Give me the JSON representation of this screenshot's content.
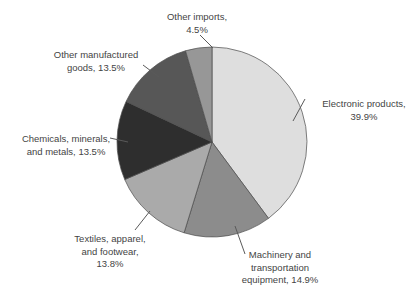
{
  "chart_data": {
    "type": "pie",
    "title": "",
    "unit": "%",
    "start_angle_deg": 0,
    "direction": "clockwise",
    "background_color": "#ffffff",
    "label_color": "#444444",
    "outline_color": "#4c4c4c",
    "leader_color": "#5a5a5a",
    "slices": [
      {
        "label": "Electronic products",
        "value": 39.9,
        "color": "#dedede",
        "label_lines": [
          "Electronic products,",
          "39.9%"
        ]
      },
      {
        "label": "Machinery and transportation equipment",
        "value": 14.9,
        "color": "#8c8c8c",
        "label_lines": [
          "Machinery and",
          "transportation",
          "equipment, 14.9%"
        ]
      },
      {
        "label": "Textiles, apparel, and footwear",
        "value": 13.8,
        "color": "#aaaaaa",
        "label_lines": [
          "Textiles, apparel,",
          "and footwear,",
          "13.8%"
        ]
      },
      {
        "label": "Chemicals, minerals, and metals",
        "value": 13.5,
        "color": "#2e2e2e",
        "label_lines": [
          "Chemicals, minerals,",
          "and metals, 13.5%"
        ]
      },
      {
        "label": "Other manufactured goods",
        "value": 13.5,
        "color": "#575757",
        "label_lines": [
          "Other manufactured",
          "goods, 13.5%"
        ]
      },
      {
        "label": "Other imports",
        "value": 4.5,
        "color": "#979797",
        "label_lines": [
          "Other imports,",
          "4.5%"
        ]
      }
    ]
  }
}
